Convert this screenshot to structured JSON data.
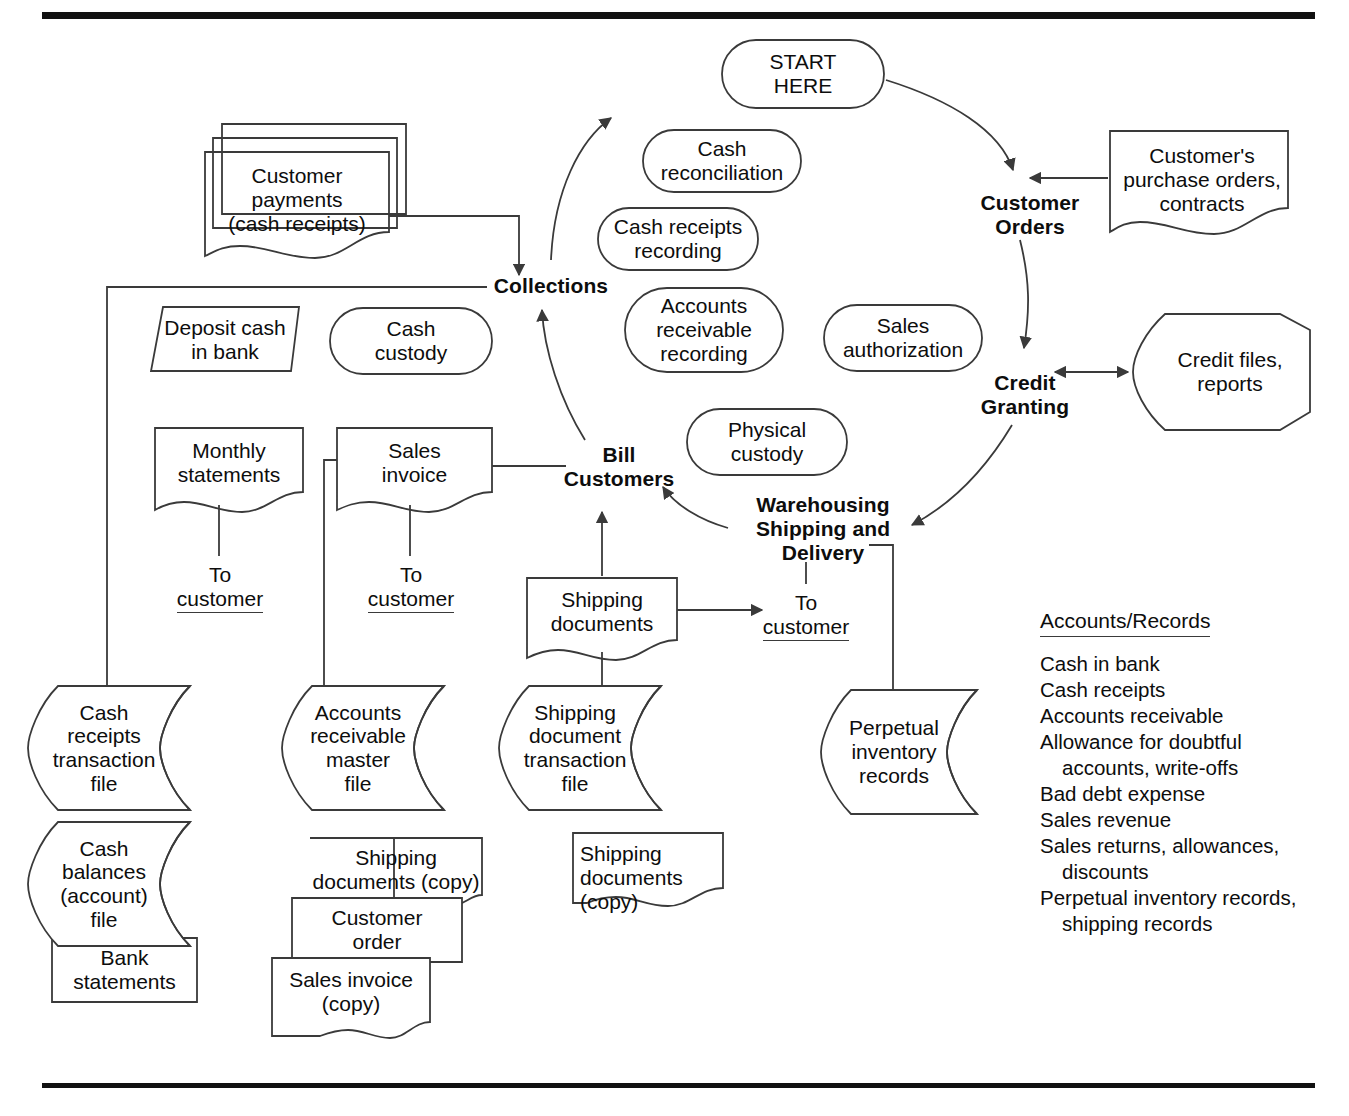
{
  "diagram": {
    "start": {
      "label": "START\nHERE"
    },
    "processes": [
      {
        "id": "customer-orders",
        "label": "Customer\nOrders"
      },
      {
        "id": "credit-granting",
        "label": "Credit\nGranting"
      },
      {
        "id": "warehousing",
        "label": "Warehousing\nShipping and\nDelivery"
      },
      {
        "id": "bill-customers",
        "label": "Bill\nCustomers"
      },
      {
        "id": "collections",
        "label": "Collections"
      }
    ],
    "operations": [
      {
        "id": "cash-reconciliation",
        "label": "Cash\nreconciliation"
      },
      {
        "id": "cash-receipts-recording",
        "label": "Cash receipts\nrecording"
      },
      {
        "id": "ar-recording",
        "label": "Accounts\nreceivable\nrecording"
      },
      {
        "id": "sales-authorization",
        "label": "Sales\nauthorization"
      },
      {
        "id": "cash-custody",
        "label": "Cash\ncustody"
      },
      {
        "id": "physical-custody",
        "label": "Physical\ncustody"
      }
    ],
    "documents": [
      {
        "id": "customer-payments",
        "label": "Customer\npayments\n(cash receipts)"
      },
      {
        "id": "customers-purchase-orders",
        "label": "Customer's\npurchase orders,\ncontracts"
      },
      {
        "id": "monthly-statements",
        "label": "Monthly\nstatements"
      },
      {
        "id": "sales-invoice",
        "label": "Sales\ninvoice"
      },
      {
        "id": "shipping-documents",
        "label": "Shipping\ndocuments"
      },
      {
        "id": "shipping-documents-copy-left",
        "label": "Shipping\ndocuments (copy)"
      },
      {
        "id": "customer-order-copy",
        "label": "Customer\norder"
      },
      {
        "id": "sales-invoice-copy",
        "label": "Sales invoice\n(copy)"
      },
      {
        "id": "shipping-documents-copy-mid",
        "label": "Shipping\ndocuments\n(copy)"
      },
      {
        "id": "bank-statements",
        "label": "Bank\nstatements"
      }
    ],
    "manual_operations": [
      {
        "id": "deposit-cash-in-bank",
        "label": "Deposit cash\nin bank"
      }
    ],
    "offpage": [
      {
        "id": "credit-files-reports",
        "label": "Credit files,\nreports"
      }
    ],
    "files": [
      {
        "id": "cash-receipts-transaction-file",
        "label": "Cash\nreceipts\ntransaction\nfile"
      },
      {
        "id": "cash-balances-account-file",
        "label": "Cash\nbalances\n(account)\nfile"
      },
      {
        "id": "ar-master-file",
        "label": "Accounts\nreceivable\nmaster\nfile"
      },
      {
        "id": "shipping-document-transaction-file",
        "label": "Shipping\ndocument\ntransaction\nfile"
      },
      {
        "id": "perpetual-inventory-records",
        "label": "Perpetual\ninventory\nrecords"
      }
    ],
    "connector_labels": [
      {
        "id": "to-customer-statements",
        "line1": "To",
        "line2": "customer"
      },
      {
        "id": "to-customer-invoice",
        "line1": "To",
        "line2": "customer"
      },
      {
        "id": "to-customer-shipping",
        "line1": "To",
        "line2": "customer"
      }
    ]
  },
  "records_panel": {
    "heading": "Accounts/Records",
    "items": [
      {
        "text": "Cash in bank",
        "indent": false
      },
      {
        "text": "Cash receipts",
        "indent": false
      },
      {
        "text": "Accounts receivable",
        "indent": false
      },
      {
        "text": "Allowance for doubtful",
        "indent": false
      },
      {
        "text": "accounts, write-offs",
        "indent": true
      },
      {
        "text": "Bad debt expense",
        "indent": false
      },
      {
        "text": "Sales revenue",
        "indent": false
      },
      {
        "text": "Sales returns, allowances,",
        "indent": false
      },
      {
        "text": "discounts",
        "indent": true
      },
      {
        "text": "Perpetual inventory records,",
        "indent": false
      },
      {
        "text": "shipping records",
        "indent": true
      }
    ]
  },
  "style": {
    "line_color": "#3a3a3a",
    "text_color": "#0d0d0d",
    "rule_color": "#111111",
    "background": "#ffffff"
  }
}
